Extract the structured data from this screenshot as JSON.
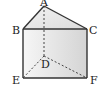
{
  "diagram": {
    "type": "triangular-prism",
    "vertices": {
      "A": {
        "label": "A",
        "x": 44,
        "y": 6
      },
      "B": {
        "label": "B",
        "x": 23,
        "y": 29
      },
      "C": {
        "label": "C",
        "x": 87,
        "y": 29
      },
      "D": {
        "label": "D",
        "x": 44,
        "y": 56
      },
      "E": {
        "label": "E",
        "x": 23,
        "y": 78
      },
      "F": {
        "label": "F",
        "x": 87,
        "y": 78
      }
    },
    "solid_edges": [
      "AB",
      "AC",
      "BC",
      "BE",
      "CF",
      "EF"
    ],
    "dashed_edges": [
      "AD",
      "DE",
      "DF"
    ],
    "colors": {
      "stroke": "#333333",
      "face_light": "#f4f4f4",
      "face_dark": "#d6d6d6"
    }
  }
}
